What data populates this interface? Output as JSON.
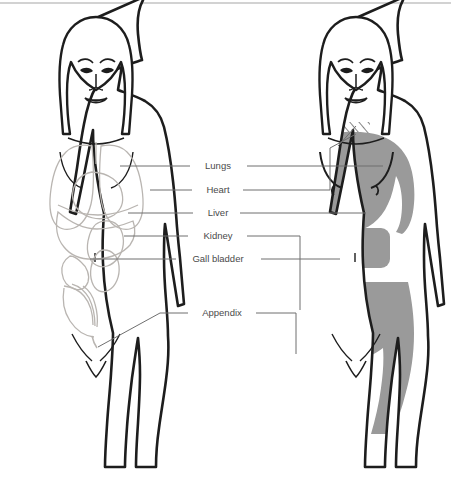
{
  "figure": {
    "kind": "anatomical-referred-pain-diagram",
    "canvas": {
      "width": 451,
      "height": 487,
      "background": "#ffffff"
    },
    "top_border": {
      "visible": true,
      "color": "#cfcfcf"
    },
    "panels": [
      {
        "id": "left-figure",
        "name": "organ-outline-figure",
        "description": "Front view line drawing of a female body with internal organs drawn in light outline",
        "fill": "#ffffff",
        "outline_color": "#1d1d1d",
        "organ_line_color": "#b9b5b1"
      },
      {
        "id": "right-figure",
        "name": "referred-pain-zones-figure",
        "description": "Front view line drawing of the same female body with shaded referred pain zones",
        "fill": "#ffffff",
        "outline_color": "#1d1d1d",
        "zone_fill": "#9a9a9a",
        "hatch_color": "#6e6e6e"
      }
    ],
    "colors": {
      "outline": "#1d1d1d",
      "organ_lines": "#b9b5b1",
      "leader_line": "#6f6f6f",
      "label_text": "#4a4a4a",
      "pain_zone_gray": "#9a9a9a",
      "hatch_stripe": "#6e6e6e",
      "background": "#ffffff"
    },
    "organs": [
      {
        "key": "lungs",
        "label": "Lungs",
        "label_x": 218,
        "label_y": 169,
        "leader_left_from_x": 190,
        "leader_left_to_x": 120,
        "leader_right_from_x": 247,
        "leader_right_to_x": 383,
        "leader_y": 166,
        "zone": "left chest, breast and inner upper arm"
      },
      {
        "key": "heart",
        "label": "Heart",
        "label_x": 218,
        "label_y": 193,
        "leader_left_from_x": 192,
        "leader_left_to_x": 148,
        "leader_right_from_x": 243,
        "leader_right_to_x": 330,
        "leader_y": 190,
        "zone": "left chest, neck and shoulder (hatched)"
      },
      {
        "key": "liver",
        "label": "Liver",
        "label_x": 218,
        "label_y": 216,
        "leader_left_from_x": 193,
        "leader_left_to_x": 128,
        "leader_right_from_x": 240,
        "leader_right_to_x": 366,
        "leader_y": 213,
        "zone": "right upper abdomen and shoulder"
      },
      {
        "key": "kidney",
        "label": "Kidney",
        "label_x": 218,
        "label_y": 239,
        "leader_left_from_x": 188,
        "leader_left_to_x": 124,
        "leader_right_from_x": 247,
        "leader_right_to_x": 300,
        "leader_y": 236,
        "zone": "flank and lower abdomen"
      },
      {
        "key": "gall-bladder",
        "label": "Gall bladder",
        "label_x": 218,
        "label_y": 262,
        "leader_left_from_x": 176,
        "leader_left_to_x": 90,
        "leader_right_from_x": 261,
        "leader_right_to_x": 330,
        "leader_y": 259,
        "zone": "upper central abdomen"
      },
      {
        "key": "appendix",
        "label": "Appendix",
        "label_x": 222,
        "label_y": 316,
        "leader_left_from_x": 188,
        "leader_left_to_x": 160,
        "leader_right_from_x": 256,
        "leader_right_to_x": 290,
        "leader_y": 313,
        "zone": "right lower abdomen and groin (hatched band)"
      }
    ]
  }
}
